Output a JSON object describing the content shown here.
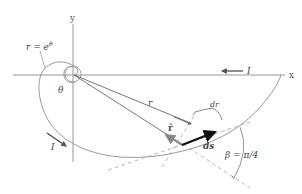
{
  "diagram": {
    "type": "logarithmic spiral path diagram",
    "axes": {
      "x_label": "x",
      "y_label": "y"
    },
    "curve_label": "r = e^θ",
    "curve_label_parts": {
      "lhs": "r = e",
      "exponent": "θ"
    },
    "angle_label": "θ",
    "radius_label": "r",
    "dr_label": "dr",
    "unit_vector_label": "r̂",
    "ds_label": "ds",
    "beta_label": "β = π/4",
    "current_labels": {
      "top": "I",
      "bottom": "I"
    },
    "colors": {
      "axis": "#8a8a8a",
      "curve": "#9a9a9a",
      "radius_line": "#555555",
      "ds_vector": "#111111",
      "rhat_vector": "#888888",
      "dashed": "#999999",
      "text": "#444444"
    }
  }
}
